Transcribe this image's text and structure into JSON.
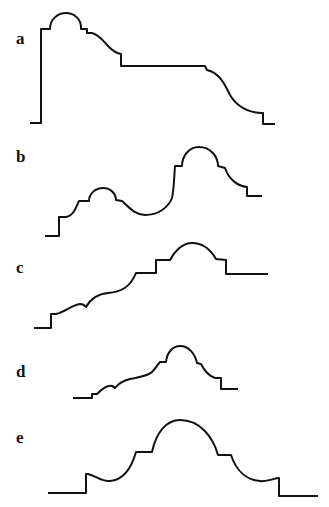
{
  "figure": {
    "panels": [
      {
        "id": "a",
        "label": "a",
        "label_pos": [
          16,
          30
        ]
      },
      {
        "id": "b",
        "label": "b",
        "label_pos": [
          16,
          150
        ]
      },
      {
        "id": "c",
        "label": "c",
        "label_pos": [
          16,
          262
        ]
      },
      {
        "id": "d",
        "label": "d",
        "label_pos": [
          16,
          364
        ]
      },
      {
        "id": "e",
        "label": "e",
        "label_pos": [
          16,
          430
        ]
      }
    ],
    "stroke_color": "#111111",
    "background": "#ffffff"
  }
}
